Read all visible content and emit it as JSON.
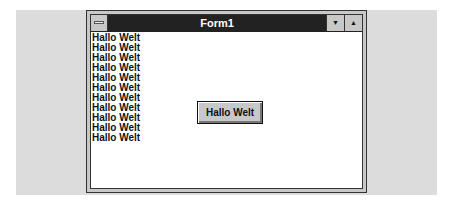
{
  "window": {
    "title": "Form1",
    "sysmenu_icon": "system-menu-icon",
    "minimize_icon": "▼",
    "maximize_icon": "▲"
  },
  "client": {
    "lines": [
      "Hallo Welt",
      "Hallo Welt",
      "Hallo Welt",
      "Hallo Welt",
      "Hallo Welt",
      "Hallo Welt",
      "Hallo Welt",
      "Hallo Welt",
      "Hallo Welt",
      "Hallo Welt",
      "Hallo Welt"
    ],
    "button_label": "Hallo Welt"
  }
}
